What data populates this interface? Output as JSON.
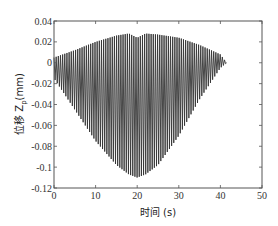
{
  "chart_data": {
    "type": "line",
    "title": "",
    "xlabel": "时间 (s)",
    "ylabel": "位移 Z_p(mm)",
    "ylabel_main": "位移 Z",
    "ylabel_sub": "p",
    "ylabel_unit": "(mm)",
    "xlim": [
      0,
      50
    ],
    "ylim": [
      -0.12,
      0.04
    ],
    "xticks": [
      0,
      10,
      20,
      30,
      40,
      50
    ],
    "yticks": [
      0.04,
      0.02,
      0,
      -0.02,
      -0.04,
      -0.06,
      -0.08,
      -0.1,
      -0.12
    ],
    "xtick_labels": [
      "0",
      "10",
      "20",
      "30",
      "40",
      "50"
    ],
    "ytick_labels": [
      "0.04",
      "0.02",
      "0",
      "-0.02",
      "-0.04",
      "-0.06",
      "-0.08",
      "-0.1",
      "-0.12"
    ],
    "grid": false,
    "legend": null,
    "series": [
      {
        "name": "Z_p displacement (dense oscillation envelope)",
        "color": "#333333",
        "upper_envelope": {
          "t": [
            0,
            5,
            10,
            15,
            18,
            20,
            22,
            25,
            30,
            35,
            40,
            41.5
          ],
          "z": [
            0.005,
            0.012,
            0.02,
            0.026,
            0.028,
            0.024,
            0.028,
            0.027,
            0.024,
            0.017,
            0.008,
            0.0
          ]
        },
        "lower_envelope": {
          "t": [
            0,
            5,
            10,
            15,
            18,
            20,
            22,
            25,
            30,
            35,
            40,
            41.5
          ],
          "z": [
            -0.015,
            -0.045,
            -0.075,
            -0.098,
            -0.107,
            -0.11,
            -0.107,
            -0.098,
            -0.07,
            -0.035,
            -0.005,
            0.0
          ]
        },
        "oscillation_count": 80
      }
    ]
  }
}
